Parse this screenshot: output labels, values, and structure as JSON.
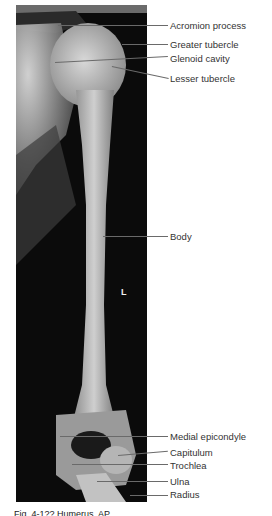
{
  "figure": {
    "side_marker": "L",
    "caption_partial": "Fig. 4-1??  Humerus, AP",
    "labels": [
      {
        "id": "acromion-process",
        "text": "Acromion process"
      },
      {
        "id": "greater-tubercle",
        "text": "Greater tubercle"
      },
      {
        "id": "glenoid-cavity",
        "text": "Glenoid cavity"
      },
      {
        "id": "lesser-tubercle",
        "text": "Lesser tubercle"
      },
      {
        "id": "body",
        "text": "Body"
      },
      {
        "id": "medial-epicondyle",
        "text": "Medial epicondyle"
      },
      {
        "id": "capitulum",
        "text": "Capitulum"
      },
      {
        "id": "trochlea",
        "text": "Trochlea"
      },
      {
        "id": "ulna",
        "text": "Ulna"
      },
      {
        "id": "radius",
        "text": "Radius"
      }
    ]
  }
}
